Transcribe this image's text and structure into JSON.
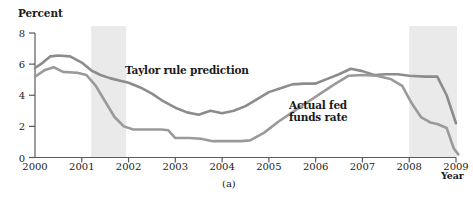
{
  "figure": {
    "caption": "(a)",
    "y_axis_title": "Percent",
    "x_axis_title": "Year"
  },
  "chart_data": {
    "type": "line",
    "title": "",
    "subtitle": "",
    "xlabel": "Year",
    "ylabel": "Percent",
    "xlim": [
      2000,
      2009
    ],
    "ylim": [
      0,
      8
    ],
    "yticks": [
      0,
      2,
      4,
      6,
      8
    ],
    "xticks": [
      2000,
      2001,
      2002,
      2003,
      2004,
      2005,
      2006,
      2007,
      2008,
      2009
    ],
    "ytick_labels": [
      "0",
      "2",
      "4",
      "6",
      "8"
    ],
    "xtick_labels": [
      "2000",
      "2001",
      "2002",
      "2003",
      "2004",
      "2005",
      "2006",
      "2007",
      "2008",
      "2009"
    ],
    "grid": false,
    "legend_position": "inline-annotation",
    "annotations": [
      {
        "name": "taylor-rule-label",
        "text": "Taylor rule prediction",
        "x": 2002.1,
        "y": 4.85
      },
      {
        "name": "actual-fed-funds-label",
        "text": "Actual fed\nfunds rate",
        "x": 2005.6,
        "y": 2.6
      }
    ],
    "shaded_regions": [
      {
        "name": "recession-2001",
        "label": "Recession",
        "x_start": 2001.2,
        "x_end": 2001.95,
        "color": "#eaeaea"
      },
      {
        "name": "recession-2008",
        "label": "Recession",
        "x_start": 2008.0,
        "x_end": 2009.15,
        "color": "#eaeaea"
      }
    ],
    "series": [
      {
        "name": "Taylor rule prediction",
        "color": "#8c8c8c",
        "x": [
          2000.0,
          2000.17,
          2000.33,
          2000.5,
          2000.75,
          2001.0,
          2001.2,
          2001.4,
          2001.6,
          2001.8,
          2002.0,
          2002.25,
          2002.5,
          2002.75,
          2003.0,
          2003.25,
          2003.5,
          2003.75,
          2004.0,
          2004.25,
          2004.5,
          2004.75,
          2005.0,
          2005.25,
          2005.5,
          2005.75,
          2006.0,
          2006.25,
          2006.5,
          2006.75,
          2007.0,
          2007.25,
          2007.5,
          2007.75,
          2008.0,
          2008.35,
          2008.6,
          2008.8,
          2009.0
        ],
        "values": [
          5.75,
          6.1,
          6.5,
          6.55,
          6.5,
          6.1,
          5.6,
          5.3,
          5.1,
          4.95,
          4.8,
          4.5,
          4.1,
          3.6,
          3.2,
          2.9,
          2.75,
          3.0,
          2.85,
          3.0,
          3.3,
          3.75,
          4.2,
          4.45,
          4.7,
          4.75,
          4.75,
          5.05,
          5.35,
          5.7,
          5.55,
          5.3,
          5.35,
          5.35,
          5.25,
          5.2,
          5.2,
          4.0,
          2.2
        ]
      },
      {
        "name": "Actual fed funds rate",
        "color": "#9a9a9a",
        "x": [
          2000.0,
          2000.2,
          2000.4,
          2000.6,
          2000.9,
          2001.1,
          2001.3,
          2001.5,
          2001.7,
          2001.9,
          2002.1,
          2002.4,
          2002.7,
          2002.85,
          2003.0,
          2003.3,
          2003.55,
          2003.8,
          2004.1,
          2004.4,
          2004.6,
          2004.9,
          2005.2,
          2005.5,
          2005.8,
          2006.1,
          2006.4,
          2006.7,
          2007.0,
          2007.3,
          2007.6,
          2007.85,
          2008.05,
          2008.25,
          2008.45,
          2008.6,
          2008.8,
          2008.95,
          2009.05
        ],
        "values": [
          5.2,
          5.6,
          5.8,
          5.5,
          5.45,
          5.3,
          4.6,
          3.6,
          2.6,
          2.0,
          1.8,
          1.8,
          1.8,
          1.75,
          1.25,
          1.25,
          1.2,
          1.05,
          1.05,
          1.05,
          1.1,
          1.6,
          2.3,
          2.9,
          3.5,
          4.1,
          4.7,
          5.25,
          5.3,
          5.25,
          5.05,
          4.6,
          3.5,
          2.6,
          2.25,
          2.15,
          1.9,
          0.6,
          0.2
        ]
      }
    ]
  }
}
